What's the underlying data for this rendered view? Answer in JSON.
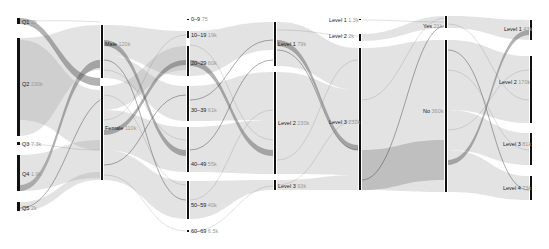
{
  "diagram": {
    "type": "parallel-sets",
    "colors": {
      "axis": "#111111",
      "ribbon": "#9a9a9a",
      "label": "#222222",
      "count": "#999999",
      "background": "#ffffff"
    },
    "dimensions": [
      {
        "name": "quartile",
        "x": 18,
        "categories": [
          {
            "label": "Q1",
            "count": "2k",
            "y0": 18,
            "y1": 24
          },
          {
            "label": "Q2",
            "count": "230k",
            "y0": 38,
            "y1": 136
          },
          {
            "label": "Q3",
            "count": "7.3k",
            "y0": 143,
            "y1": 145
          },
          {
            "label": "Q4",
            "count": "1.9k",
            "y0": 155,
            "y1": 191
          },
          {
            "label": "Q5",
            "count": "2k",
            "y0": 202,
            "y1": 211
          }
        ]
      },
      {
        "name": "gender",
        "x": 102,
        "categories": [
          {
            "label": "Male",
            "count": "120k",
            "y0": 25,
            "y1": 78
          },
          {
            "label": "Female",
            "count": "110k",
            "y0": 86,
            "y1": 180
          }
        ]
      },
      {
        "name": "age",
        "x": 188,
        "categories": [
          {
            "label": "0–9",
            "count": "75",
            "y0": 20,
            "y1": 20
          },
          {
            "label": "10–19",
            "count": "19k",
            "y0": 31,
            "y1": 38
          },
          {
            "label": "20–29",
            "count": "60k",
            "y0": 46,
            "y1": 76
          },
          {
            "label": "30–39",
            "count": "61k",
            "y0": 86,
            "y1": 121
          },
          {
            "label": "40–49",
            "count": "55k",
            "y0": 127,
            "y1": 172
          },
          {
            "label": "50–59",
            "count": "40k",
            "y0": 181,
            "y1": 219
          },
          {
            "label": "60–69",
            "count": "6.5k",
            "y0": 231,
            "y1": 232
          }
        ]
      },
      {
        "name": "level-a",
        "x": 275,
        "categories": [
          {
            "label": "Level 1",
            "count": "79k",
            "y0": 22,
            "y1": 66
          },
          {
            "label": "Level 2",
            "count": "230k",
            "y0": 72,
            "y1": 174
          },
          {
            "label": "Level 3",
            "count": "93k",
            "y0": 180,
            "y1": 190
          }
        ]
      },
      {
        "name": "level-b",
        "x": 360,
        "categories": [
          {
            "label": "Level 1",
            "count": "1.3k",
            "y0": 20,
            "y1": 20
          },
          {
            "label": "Level 2",
            "count": "2k",
            "y0": 34,
            "y1": 41
          },
          {
            "label": "Level 3",
            "count": "230k",
            "y0": 48,
            "y1": 190
          }
        ]
      },
      {
        "name": "yes-no",
        "x": 446,
        "categories": [
          {
            "label": "Yes",
            "count": "21k",
            "y0": 16,
            "y1": 28
          },
          {
            "label": "No",
            "count": "360k",
            "y0": 40,
            "y1": 192
          }
        ]
      },
      {
        "name": "level-c",
        "x": 531,
        "categories": [
          {
            "label": "Level 1",
            "count": "43k",
            "y0": 20,
            "y1": 40
          },
          {
            "label": "Level 2",
            "count": "170k",
            "y0": 56,
            "y1": 123
          },
          {
            "label": "Level 3",
            "count": "81k",
            "y0": 133,
            "y1": 165
          },
          {
            "label": "Level 4",
            "count": "73k",
            "y0": 176,
            "y1": 200
          }
        ]
      }
    ]
  },
  "labels": {
    "d0": [
      "Q1",
      "Q2",
      "Q3",
      "Q4",
      "Q5"
    ],
    "d0c": [
      "2k",
      "230k",
      "7.3k",
      "1.9k",
      "2k"
    ],
    "d1": [
      "Male",
      "Female"
    ],
    "d1c": [
      "120k",
      "110k"
    ],
    "d2": [
      "0–9",
      "10–19",
      "20–29",
      "30–39",
      "40–49",
      "50–59",
      "60–69"
    ],
    "d2c": [
      "75",
      "19k",
      "60k",
      "61k",
      "55k",
      "40k",
      "6.5k"
    ],
    "d3": [
      "Level 1",
      "Level 2",
      "Level 3"
    ],
    "d3c": [
      "79k",
      "230k",
      "93k"
    ],
    "d4": [
      "Level 1",
      "Level 2",
      "Level 3"
    ],
    "d4c": [
      "1.3k",
      "2k",
      "230k"
    ],
    "d5": [
      "Yes",
      "No"
    ],
    "d5c": [
      "21k",
      "360k"
    ],
    "d6": [
      "Level 1",
      "Level 2",
      "Level 3",
      "Level 4"
    ],
    "d6c": [
      "43k",
      "170k",
      "81k",
      "73k"
    ]
  }
}
